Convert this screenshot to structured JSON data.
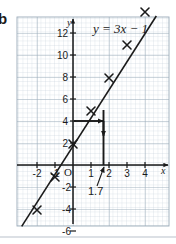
{
  "figure": {
    "part_label": "b",
    "equation_label": "y = 3x − 1",
    "axis_labels": {
      "x": "x",
      "y": "y",
      "origin": "O"
    },
    "annotation": {
      "value_label": "1.7"
    },
    "colors": {
      "grid_minor": "#c8d2dc",
      "grid_major": "#93a3b3",
      "ink": "#1a1a1a",
      "paper": "#ffffff",
      "rule": "#b9c2cb"
    },
    "x_ticks": [
      {
        "label": "-2",
        "value": -2
      },
      {
        "label": "-1",
        "value": -1
      },
      {
        "label": "1",
        "value": 1
      },
      {
        "label": "2",
        "value": 2
      },
      {
        "label": "3",
        "value": 3
      },
      {
        "label": "4",
        "value": 4
      }
    ],
    "y_ticks": [
      {
        "label": "12",
        "value": 12
      },
      {
        "label": "10",
        "value": 10
      },
      {
        "label": "8",
        "value": 8
      },
      {
        "label": "6",
        "value": 6
      },
      {
        "label": "4",
        "value": 4
      },
      {
        "label": "2",
        "value": 2
      },
      {
        "label": "-2",
        "value": -2
      },
      {
        "label": "-4",
        "value": -4
      },
      {
        "label": "-6",
        "value": -6
      },
      {
        "label": "-8",
        "value": -8
      }
    ]
  },
  "chart_data": {
    "type": "line",
    "title": "y = 3x − 1",
    "xlabel": "x",
    "ylabel": "y",
    "xlim": [
      -2.9,
      4.9
    ],
    "ylim": [
      -8.5,
      13.5
    ],
    "grid": true,
    "legend": "none",
    "series": [
      {
        "name": "y = 3x − 1",
        "equation": "y = 3x - 1",
        "slope": 3,
        "intercept": -1,
        "marker": "x",
        "points": [
          {
            "x": -2,
            "y": -7
          },
          {
            "x": -1,
            "y": -4
          },
          {
            "x": 0,
            "y": -1
          },
          {
            "x": 1,
            "y": 2
          },
          {
            "x": 2,
            "y": 5
          },
          {
            "x": 3,
            "y": 8
          },
          {
            "x": 4,
            "y": 11
          }
        ]
      }
    ],
    "annotations": [
      {
        "type": "read-off-arrow",
        "text": "1.7",
        "from": {
          "x": 0,
          "y": 4
        },
        "via": {
          "x": 1.7,
          "y": 4
        },
        "to": {
          "x": 1.7,
          "y": 0
        },
        "description": "Horizontal arrow from y = 4 to the line, then vertical arrow down to x ≈ 1.7"
      }
    ],
    "x_tick_values": [
      -2,
      -1,
      1,
      2,
      3,
      4
    ],
    "y_tick_values": [
      12,
      10,
      8,
      6,
      4,
      2,
      -2,
      -4,
      -6,
      -8
    ]
  }
}
